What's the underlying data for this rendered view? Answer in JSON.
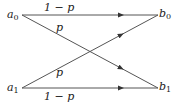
{
  "diagram": {
    "nodes": {
      "a0": {
        "label": "a",
        "sub": "0"
      },
      "a1": {
        "label": "a",
        "sub": "1"
      },
      "b0": {
        "label": "b",
        "sub": "0"
      },
      "b1": {
        "label": "b",
        "sub": "1"
      }
    },
    "edges": [
      {
        "from": "a0",
        "to": "b0",
        "label": "1 − p"
      },
      {
        "from": "a0",
        "to": "b1",
        "label": "p"
      },
      {
        "from": "a1",
        "to": "b0",
        "label": "p"
      },
      {
        "from": "a1",
        "to": "b1",
        "label": "1 − p"
      }
    ],
    "colors": {
      "line": "#555555",
      "text": "#1a1a1a",
      "background": "#ffffff"
    }
  }
}
